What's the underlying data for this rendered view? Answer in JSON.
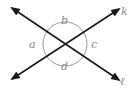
{
  "diagram": {
    "lines": [
      {
        "name": "k",
        "label": "k"
      },
      {
        "name": "l",
        "label": "ℓ"
      }
    ],
    "angles": [
      {
        "name": "a",
        "label": "a"
      },
      {
        "name": "b",
        "label": "b"
      },
      {
        "name": "c",
        "label": "c"
      },
      {
        "name": "d",
        "label": "d"
      }
    ],
    "colors": {
      "line": "#1a1a1a",
      "arc": "#9a9a9a",
      "label": "#8a8a8a"
    }
  }
}
